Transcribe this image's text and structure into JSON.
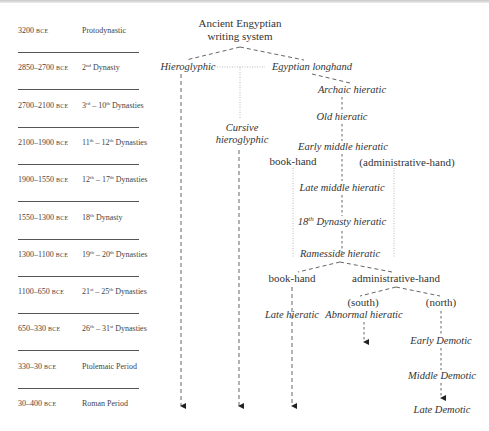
{
  "timeline": {
    "era_label": "BCE",
    "rows": [
      {
        "date": "3200",
        "era": "BCE",
        "period": "Protodynastic"
      },
      {
        "date": "2850–2700",
        "era": "BCE",
        "period_parts": [
          "2",
          "nd",
          " Dynasty"
        ]
      },
      {
        "date": "2700–2100",
        "era": "BCE",
        "period_parts": [
          "3",
          "rd",
          " – 10",
          "th",
          " Dynasties"
        ]
      },
      {
        "date": "2100–1900",
        "era": "BCE",
        "period_parts": [
          "11",
          "th",
          " – 12",
          "th",
          " Dynasties"
        ]
      },
      {
        "date": "1900–1550",
        "era": "BCE",
        "period_parts": [
          "12",
          "th",
          " – 17",
          "th",
          " Dynasties"
        ]
      },
      {
        "date": "1550–1300",
        "era": "BCE",
        "period_parts": [
          "18",
          "th",
          " Dynasty"
        ]
      },
      {
        "date": "1300–1100",
        "era": "BCE",
        "period_parts": [
          "19",
          "th",
          " – 20",
          "th",
          " Dynasties"
        ]
      },
      {
        "date": "1100–650",
        "era": "BCE",
        "period_parts": [
          "21",
          "st",
          " – 25",
          "th",
          " Dynasties"
        ]
      },
      {
        "date": "650–330",
        "era": "BCE",
        "period_parts": [
          "26",
          "th",
          " – 31",
          "st",
          " Dynasties"
        ]
      },
      {
        "date": "330–30",
        "era": "BCE",
        "period": "Ptolemaic Period"
      },
      {
        "date": "30–400",
        "era": "BCE",
        "period": "Roman Period"
      }
    ]
  },
  "tree": {
    "root": {
      "line1": "Ancient Engyptian",
      "line2": "writing system"
    },
    "hieroglyphic": "Hieroglyphic",
    "egyptian_longhand": "Egyptian longhand",
    "archaic_hieratic": "Archaic hieratic",
    "old_hieratic": "Old hieratic",
    "cursive_hieroglyphic": {
      "line1": "Cursive",
      "line2": "hieroglyphic"
    },
    "early_middle_hieratic": "Early middle hieratic",
    "book_hand_1": "book-hand",
    "administrative_hand_1": "(administrative-hand)",
    "late_middle_hieratic": "Late middle hieratic",
    "dynasty18_hieratic": {
      "num": "18",
      "sup": "th",
      "rest": " Dynasty hieratic"
    },
    "ramesside_hieratic": "Ramesside hieratic",
    "book_hand_2": "book-hand",
    "administrative_hand_2": "administrative-hand",
    "south": "(south)",
    "north": "(north)",
    "late_hieratic": "Late hieratic",
    "abnormal_hieratic": "Abnormal hieratic",
    "early_demotic": "Early Demotic",
    "middle_demotic": "Middle Demotic",
    "late_demotic": "Late Demotic"
  },
  "colors": {
    "ink": "#333333",
    "line": "#555555",
    "dotted": "#999999"
  }
}
